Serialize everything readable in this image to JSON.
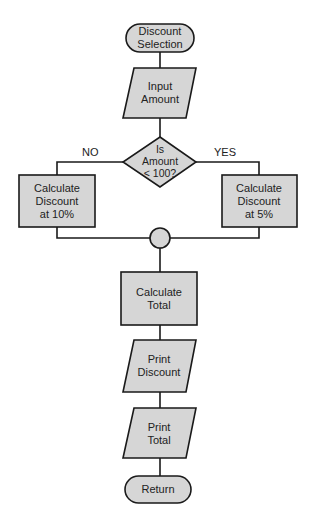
{
  "colors": {
    "shape_fill": "#d6d6d6",
    "stroke": "#1a1a1a",
    "text": "#222222",
    "background": "#ffffff"
  },
  "nodes": {
    "start": {
      "type": "terminal",
      "line1": "Discount",
      "line2": "Selection"
    },
    "input": {
      "type": "io",
      "line1": "Input",
      "line2": "Amount"
    },
    "decision": {
      "type": "decision",
      "line1": "Is",
      "line2": "Amount",
      "line3": "< 100?"
    },
    "left_process": {
      "type": "process",
      "line1": "Calculate",
      "line2": "Discount",
      "line3": "at 10%"
    },
    "right_process": {
      "type": "process",
      "line1": "Calculate",
      "line2": "Discount",
      "line3": "at 5%"
    },
    "connector": {
      "type": "connector"
    },
    "total": {
      "type": "process",
      "line1": "Calculate",
      "line2": "Total"
    },
    "print_discount": {
      "type": "io",
      "line1": "Print",
      "line2": "Discount"
    },
    "print_total": {
      "type": "io",
      "line1": "Print",
      "line2": "Total"
    },
    "end": {
      "type": "terminal",
      "line1": "Return"
    }
  },
  "branches": {
    "no": "NO",
    "yes": "YES"
  }
}
